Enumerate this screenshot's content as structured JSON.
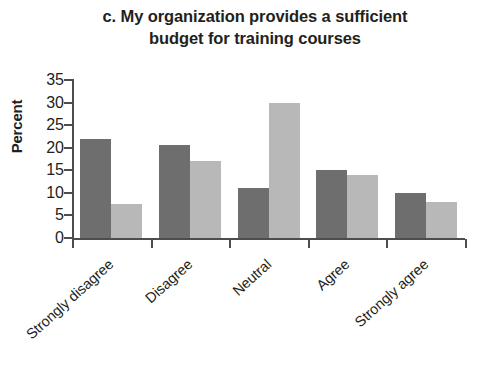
{
  "chart_data": {
    "type": "bar",
    "title": "c. My organization provides a sufficient\nbudget for training courses",
    "title_line1": "c. My organization provides a sufficient",
    "title_line2": "budget for training courses",
    "xlabel": "",
    "ylabel": "Percent",
    "ylim": [
      0,
      35
    ],
    "ytick_labels": [
      "35",
      "30",
      "25",
      "20",
      "15",
      "10",
      "5",
      "0"
    ],
    "ytick_values": [
      35,
      30,
      25,
      20,
      15,
      10,
      5,
      0
    ],
    "grid": false,
    "legend": "none",
    "categories": [
      "Strongly disagree",
      "Disagree",
      "Neutral",
      "Agree",
      "Strongly agree"
    ],
    "series": [
      {
        "name": "series-1",
        "color": "#6e6e6e",
        "values": [
          22,
          20.5,
          11,
          15,
          10
        ]
      },
      {
        "name": "series-2",
        "color": "#b8b8b8",
        "values": [
          7.5,
          17,
          30,
          14,
          8
        ]
      }
    ]
  }
}
